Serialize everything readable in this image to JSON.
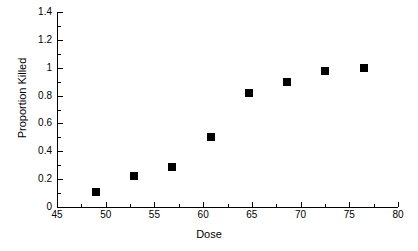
{
  "chart_data": {
    "type": "scatter",
    "title": "",
    "xlabel": "Dose",
    "ylabel": "Proportion Killed",
    "xlim": [
      45,
      80
    ],
    "ylim": [
      0,
      1.4
    ],
    "grid": false,
    "legend": null,
    "x_ticks": [
      "45",
      "50",
      "55",
      "60",
      "65",
      "70",
      "75",
      "80"
    ],
    "x_tick_values": [
      45,
      50,
      55,
      60,
      65,
      70,
      75,
      80
    ],
    "x_minor_tick_values": [
      47.5,
      52.5,
      57.5,
      62.5,
      67.5,
      72.5,
      77.5
    ],
    "y_ticks": [
      "0",
      "0.2",
      "0.4",
      "0.6",
      "0.8",
      "1",
      "1.2",
      "1.4"
    ],
    "y_tick_values": [
      0,
      0.2,
      0.4,
      0.6,
      0.8,
      1.0,
      1.2,
      1.4
    ],
    "y_minor_tick_values": [
      0.1,
      0.3,
      0.5,
      0.7,
      0.9,
      1.1,
      1.3
    ],
    "marker": "filled-square",
    "marker_color": "#000000",
    "points": [
      {
        "x": 49.0,
        "y": 0.11
      },
      {
        "x": 52.9,
        "y": 0.22
      },
      {
        "x": 56.8,
        "y": 0.29
      },
      {
        "x": 60.8,
        "y": 0.5
      },
      {
        "x": 64.7,
        "y": 0.82
      },
      {
        "x": 68.6,
        "y": 0.9
      },
      {
        "x": 72.5,
        "y": 0.98
      },
      {
        "x": 76.5,
        "y": 1.0
      }
    ]
  },
  "axis_titles": {
    "x": "Dose",
    "y": "Proportion Killed"
  }
}
